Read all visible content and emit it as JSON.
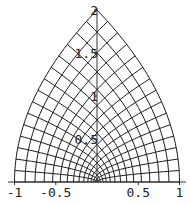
{
  "chart_data": {
    "type": "line",
    "title": "",
    "xlabel": "",
    "ylabel": "",
    "grid_divisions": 15,
    "xlim": [
      -1,
      1
    ],
    "ylim": [
      0,
      2
    ],
    "x_ticks": [
      -1,
      -0.5,
      0.5,
      1
    ],
    "x_tick_labels": [
      "-1",
      "-0.5",
      "0.5",
      "1"
    ],
    "y_ticks": [
      0.5,
      1,
      1.5,
      2
    ],
    "y_tick_labels": [
      "0.5",
      "1",
      "1.5",
      "2"
    ],
    "boundary_points": [
      [
        1,
        0
      ],
      [
        0,
        2
      ],
      [
        -1,
        0
      ],
      [
        0,
        0
      ]
    ],
    "grid": false
  },
  "style": {
    "line_color": "#1a1a1a",
    "axis_color": "#333333",
    "background": "#ffffff"
  },
  "layout": {
    "origin_px": [
      97,
      182
    ],
    "x_unit_px": 82.5,
    "y_unit_px": 86
  }
}
